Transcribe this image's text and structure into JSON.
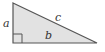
{
  "figure": {
    "type": "right-triangle",
    "fill_color": "#e2e2e2",
    "stroke_color": "#555555",
    "labels": {
      "side_a": "a",
      "side_b": "b",
      "side_c": "c"
    },
    "right_angle_marker": true
  }
}
